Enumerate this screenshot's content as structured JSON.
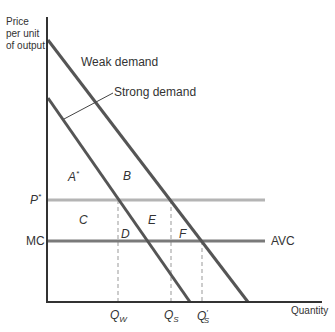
{
  "diagram": {
    "y_axis_label_lines": [
      "Price",
      "per unit",
      "of output"
    ],
    "x_axis_label": "Quantity",
    "curves": {
      "upper_demand_label": "Weak demand",
      "lower_demand_label": "Strong demand",
      "price_line_label": "P",
      "price_line_sup": "*",
      "cost_line_left_label": "MC",
      "cost_line_right_label": "AVC"
    },
    "regions": {
      "a": "A",
      "a_sup": "*",
      "b": "B",
      "c": "C",
      "d": "D",
      "e": "E",
      "f": "F"
    },
    "quantities": {
      "qw_main": "Q",
      "qw_sub": "W",
      "qs_main": "Q",
      "qs_sub": "S",
      "qs_prime_main": "Q",
      "qs_prime_mark": "′",
      "qs_prime_sub": "S"
    },
    "colors": {
      "axis": "#333333",
      "demand": "#555555",
      "price_line": "#b4b4b4",
      "cost_line": "#7a7a7a",
      "dashed": "#999999"
    }
  }
}
